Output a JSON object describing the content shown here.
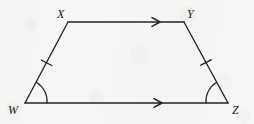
{
  "figure": {
    "name": "trapezoid-wxyz",
    "stroke_color": "#242424",
    "background_color": "#f6f6f5",
    "label_color": "#1b1b1b",
    "vertices": [
      {
        "id": "X",
        "label": "X",
        "x": 68,
        "y": 22,
        "label_x": 57,
        "label_y": 8
      },
      {
        "id": "Y",
        "label": "Y",
        "x": 184,
        "y": 22,
        "label_x": 187,
        "label_y": 8
      },
      {
        "id": "Z",
        "label": "Z",
        "x": 228,
        "y": 103,
        "label_x": 232,
        "label_y": 104
      },
      {
        "id": "W",
        "label": "W",
        "x": 25,
        "y": 103,
        "label_x": 8,
        "label_y": 104
      }
    ],
    "sides": [
      {
        "id": "XY",
        "from": "X",
        "to": "Y",
        "marks": "single-arrow",
        "note": "top base, parallel"
      },
      {
        "id": "YZ",
        "from": "Y",
        "to": "Z",
        "marks": "single-tick",
        "note": "right leg, congruent"
      },
      {
        "id": "WZ",
        "from": "W",
        "to": "Z",
        "marks": "single-arrow",
        "note": "bottom base, parallel"
      },
      {
        "id": "WX",
        "from": "W",
        "to": "X",
        "marks": "single-tick",
        "note": "left leg, congruent"
      }
    ],
    "angle_marks": [
      {
        "at": "W",
        "marks": "single-arc",
        "note": "base angle"
      },
      {
        "at": "Z",
        "marks": "single-arc",
        "note": "base angle"
      }
    ]
  }
}
